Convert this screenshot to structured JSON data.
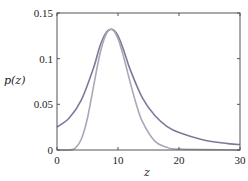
{
  "chart_data": {
    "type": "line",
    "title": "",
    "xlabel": "z",
    "ylabel": "p(z)",
    "xlim": [
      0,
      30
    ],
    "ylim": [
      0,
      0.15
    ],
    "xticks": [
      0,
      10,
      20,
      30
    ],
    "xtick_labels": [
      "0",
      "10",
      "20",
      "30"
    ],
    "yticks": [
      0,
      0.05,
      0.1,
      0.15
    ],
    "ytick_labels": [
      "0",
      "0.05",
      "0.1",
      "0.15"
    ],
    "grid": false,
    "legend": null,
    "series": [
      {
        "name": "broad (heavy-tailed) density",
        "color": "#7a7a9a",
        "x": [
          0,
          2,
          4,
          6,
          7,
          8,
          9,
          10,
          11,
          12,
          14,
          16,
          18,
          20,
          24,
          28,
          30
        ],
        "y": [
          0.025,
          0.035,
          0.055,
          0.09,
          0.113,
          0.128,
          0.132,
          0.125,
          0.108,
          0.088,
          0.057,
          0.038,
          0.026,
          0.019,
          0.011,
          0.007,
          0.006
        ]
      },
      {
        "name": "narrow density",
        "color": "#a8a8b8",
        "x": [
          0,
          2,
          3,
          4,
          5,
          6,
          7,
          8,
          9,
          10,
          11,
          12,
          13,
          14,
          16,
          18,
          20,
          30
        ],
        "y": [
          0,
          0,
          0.002,
          0.012,
          0.035,
          0.07,
          0.104,
          0.126,
          0.132,
          0.122,
          0.1,
          0.074,
          0.05,
          0.031,
          0.01,
          0.003,
          0.001,
          0
        ]
      }
    ]
  }
}
